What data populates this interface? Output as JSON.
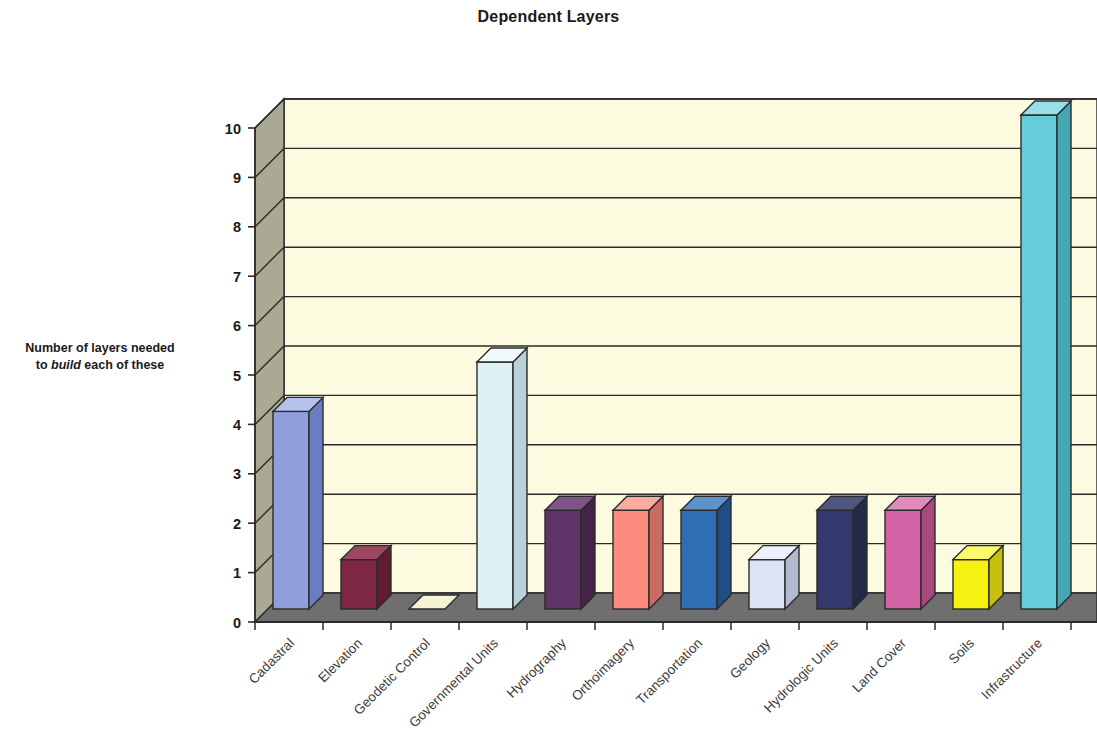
{
  "chart_data": {
    "type": "bar",
    "title": "Dependent Layers",
    "xlabel": "",
    "ylabel_line1": "Number of layers needed",
    "ylabel_line2_pre": "to ",
    "ylabel_line2_em": "build",
    "ylabel_line2_post": " each of these",
    "ylim": [
      0,
      10
    ],
    "yticks": [
      0,
      1,
      2,
      3,
      4,
      5,
      6,
      7,
      8,
      9,
      10
    ],
    "ytick_labels": [
      "0",
      "1",
      "2",
      "3",
      "4",
      "5",
      "6",
      "7",
      "8",
      "9",
      "10"
    ],
    "grid": true,
    "legend": false,
    "three_d": true,
    "categories": [
      "Cadastral",
      "Elevation",
      "Geodetic Control",
      "Governmental Units",
      "Hydrography",
      "Orthoimagery",
      "Transportation",
      "Geology",
      "Hydrologic Units",
      "Land Cover",
      "Soils",
      "Infrastructure"
    ],
    "values": [
      4,
      1,
      0,
      5,
      2,
      2,
      2,
      1,
      2,
      2,
      1,
      10
    ],
    "bar_colors": [
      "#8f9fdc",
      "#7e2742",
      "#f5f3d2",
      "#dff0f4",
      "#5f3367",
      "#fb8b7c",
      "#2f6eb5",
      "#dce3f6",
      "#33396d",
      "#d463a6",
      "#f7f112",
      "#64cdd9"
    ],
    "bar_side_colors": [
      "#6b7cc0",
      "#5e1b31",
      "#d4d2a8",
      "#b9d2da",
      "#452349",
      "#c96c63",
      "#1f4e85",
      "#b3bad0",
      "#232949",
      "#a8487f",
      "#c5c10e",
      "#46a7b4"
    ],
    "bar_top_colors": [
      "#b6c1e9",
      "#9c4862",
      "#fdfce8",
      "#f0f9fb",
      "#7d5486",
      "#fcaba0",
      "#5d92cd",
      "#eef1fb",
      "#50567f",
      "#e28bbf",
      "#fdf96a",
      "#97e0e8"
    ],
    "plot_bg_color": "#fcfbe0",
    "wall_color": "#a9a994",
    "floor_color": "#6f6f6f",
    "axis_line_color": "#2b2b2b",
    "gridline_color": "#2b2b2b",
    "title_color": "#1a1a1a",
    "xlabel_rotation_deg": -45
  }
}
